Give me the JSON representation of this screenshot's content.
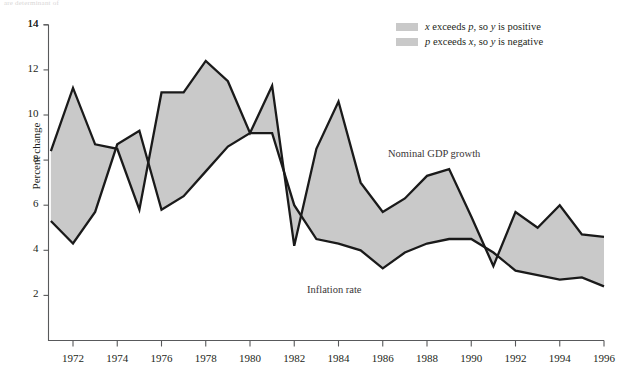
{
  "top_note": "are determinant of",
  "legend": {
    "position": "top-right",
    "items": [
      {
        "swatch_color": "#c9c9c9",
        "text_prefix": "x",
        "text_mid": " exceeds ",
        "text_var2": "p",
        "text_suffix": ", so ",
        "text_var3": "y",
        "text_end": " is positive",
        "full": "x exceeds p, so y is positive"
      },
      {
        "swatch_color": "#c9c9c9",
        "text_prefix": "p",
        "text_mid": " exceeds ",
        "text_var2": "x",
        "text_suffix": ", so ",
        "text_var3": "y",
        "text_end": " is negative",
        "full": "p exceeds x, so y is negative"
      }
    ]
  },
  "annotations": [
    {
      "name": "nominal-gdp-growth",
      "label": "Nominal GDP growth",
      "x": 388,
      "y": 148
    },
    {
      "name": "inflation-rate",
      "label": "Inflation rate",
      "x": 307,
      "y": 284
    }
  ],
  "axes": {
    "ylabel": "Percent change",
    "yticks": [
      2,
      4,
      6,
      8,
      10,
      12,
      14
    ],
    "ytick_labels": [
      "2",
      "4",
      "6",
      "8",
      "10",
      "12",
      "14"
    ],
    "xticks": [
      1972,
      1974,
      1976,
      1978,
      1980,
      1982,
      1984,
      1986,
      1988,
      1990,
      1992,
      1994,
      1996
    ],
    "xtick_labels": [
      "1972",
      "1974",
      "1976",
      "1978",
      "1980",
      "1982",
      "1984",
      "1986",
      "1988",
      "1990",
      "1992",
      "1994",
      "1996"
    ]
  },
  "colors": {
    "line": "#1a1a1a",
    "fill": "#c9c9c9",
    "axis": "#58595b",
    "text": "#231f20"
  },
  "chart_data": {
    "type": "line",
    "title": "",
    "subtitle": "",
    "xlabel": "",
    "ylabel": "Percent change",
    "xlim": [
      1971,
      1996
    ],
    "ylim": [
      0,
      14
    ],
    "grid": false,
    "legend_position": "top-right",
    "fill_between": true,
    "fill_color": "#c9c9c9",
    "x": [
      1971,
      1972,
      1973,
      1974,
      1975,
      1976,
      1977,
      1978,
      1979,
      1980,
      1981,
      1982,
      1983,
      1984,
      1985,
      1986,
      1987,
      1988,
      1989,
      1990,
      1991,
      1992,
      1993,
      1994,
      1995,
      1996
    ],
    "series": [
      {
        "name": "Nominal GDP growth",
        "values": [
          8.4,
          11.2,
          8.7,
          8.5,
          5.8,
          11.0,
          11.0,
          12.4,
          11.5,
          9.2,
          11.3,
          4.2,
          8.5,
          10.6,
          7.0,
          5.7,
          6.3,
          7.3,
          7.6,
          5.5,
          3.3,
          5.7,
          5.0,
          6.0,
          4.7,
          4.6
        ]
      },
      {
        "name": "Inflation rate",
        "values": [
          5.3,
          4.3,
          5.7,
          8.7,
          9.3,
          5.8,
          6.4,
          7.5,
          8.6,
          9.2,
          9.2,
          6.0,
          4.5,
          4.3,
          4.0,
          3.2,
          3.9,
          4.3,
          4.5,
          4.5,
          3.9,
          3.1,
          2.9,
          2.7,
          2.8,
          2.4
        ]
      }
    ]
  }
}
